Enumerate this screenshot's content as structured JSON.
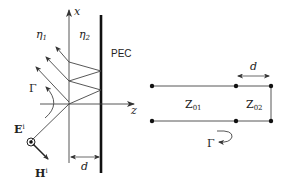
{
  "left_diagram": {
    "axis_x_label": "x",
    "axis_z_label": "z",
    "medium1_label": "η",
    "medium1_sub": "1",
    "medium2_label": "η",
    "medium2_sub": "2",
    "pec_label": "PEC",
    "reflection_label": "Γ",
    "e_field_label": "E",
    "e_field_sup": "i",
    "h_field_label": "H",
    "h_field_sup": "i",
    "thickness_label": "d"
  },
  "right_diagram": {
    "z1_label": "Z",
    "z1_sub": "01",
    "z2_label": "Z",
    "z2_sub": "02",
    "length_label": "d",
    "reflection_label": "Γ"
  },
  "colors": {
    "stroke": "#333333",
    "pec": "#111111"
  }
}
